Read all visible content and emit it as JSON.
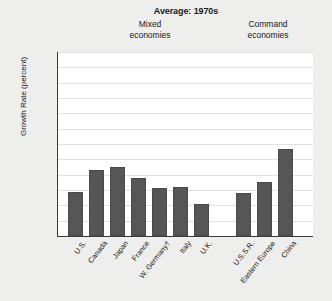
{
  "chart_data": {
    "type": "bar",
    "title": "Average: 1970s",
    "xlabel": "",
    "ylabel": "Growth Rate (percent)",
    "ylim": [
      0,
      12
    ],
    "ytick_labels": [
      "12%",
      "11",
      "10",
      "9",
      "8",
      "7",
      "6",
      "5",
      "4",
      "3",
      "2",
      "1",
      "0"
    ],
    "ytick_values": [
      12,
      11,
      10,
      9,
      8,
      7,
      6,
      5,
      4,
      3,
      2,
      1,
      0
    ],
    "grid": true,
    "legend": "none",
    "group_headers": [
      {
        "label_line1": "Mixed",
        "label_line2": "economies"
      },
      {
        "label_line1": "Command",
        "label_line2": "economies"
      }
    ],
    "categories": [
      "U.S.",
      "Canada",
      "Japan",
      "France",
      "W. Germany†",
      "Italy",
      "U.K.",
      "U.S.S.R.",
      "Eastern Europe",
      "China"
    ],
    "values": [
      2.9,
      4.3,
      4.5,
      3.8,
      3.1,
      3.2,
      2.1,
      2.8,
      3.5,
      5.7
    ],
    "series": [
      {
        "name": "Average growth rate, 1970s",
        "values": [
          2.9,
          4.3,
          4.5,
          3.8,
          3.1,
          3.2,
          2.1,
          2.8,
          3.5,
          5.7
        ]
      }
    ],
    "groups": [
      {
        "name": "Mixed economies",
        "categories": [
          "U.S.",
          "Canada",
          "Japan",
          "France",
          "W. Germany†",
          "Italy",
          "U.K."
        ],
        "values": [
          2.9,
          4.3,
          4.5,
          3.8,
          3.1,
          3.2,
          2.1
        ]
      },
      {
        "name": "Command economies",
        "categories": [
          "U.S.S.R.",
          "Eastern Europe",
          "China"
        ],
        "values": [
          2.8,
          3.5,
          5.7
        ]
      }
    ],
    "bar_color": "#565656",
    "plot_background": "#ffffff",
    "page_background": "#eeeeec"
  }
}
